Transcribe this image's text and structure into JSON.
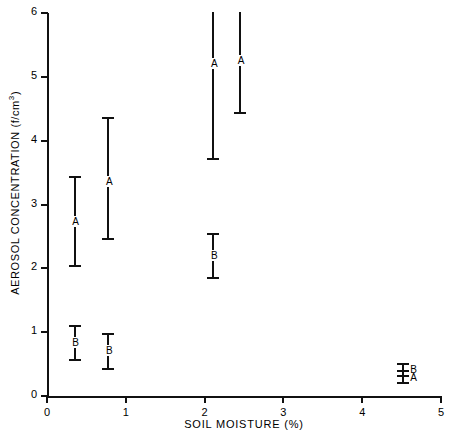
{
  "chart_data": {
    "type": "scatter",
    "title": "",
    "xlabel": "SOIL MOISTURE (%)",
    "ylabel": "AEROSOL CONCENTRATION (f/cm3)",
    "ylabel_main": "AEROSOL  CONCENTRATION  (f/cm",
    "ylabel_sup": "3",
    "ylabel_close": ")",
    "xlim": [
      0,
      5
    ],
    "ylim": [
      0,
      6
    ],
    "xticks": [
      "0",
      "1",
      "2",
      "3",
      "4",
      "5"
    ],
    "yticks": [
      "0",
      "1",
      "2",
      "3",
      "4",
      "5",
      "6"
    ],
    "grid": false,
    "legend": "none",
    "series": [
      {
        "name": "A",
        "points": [
          {
            "label": "A",
            "x": 0.35,
            "y": 2.73,
            "low": 2.02,
            "high": 3.45,
            "clipped_top": false
          },
          {
            "label": "A",
            "x": 0.78,
            "y": 3.35,
            "low": 2.45,
            "high": 4.37,
            "clipped_top": false
          },
          {
            "label": "A",
            "x": 2.11,
            "y": 5.2,
            "low": 3.7,
            "high": 6.2,
            "clipped_top": true
          },
          {
            "label": "A",
            "x": 2.45,
            "y": 5.25,
            "low": 4.42,
            "high": 6.2,
            "clipped_top": true
          },
          {
            "label": "A",
            "x": 4.52,
            "y": 0.28,
            "low": 0.18,
            "high": 0.4,
            "clipped_top": false
          }
        ]
      },
      {
        "name": "B",
        "points": [
          {
            "label": "B",
            "x": 0.35,
            "y": 0.83,
            "low": 0.55,
            "high": 1.11,
            "clipped_top": false
          },
          {
            "label": "B",
            "x": 0.78,
            "y": 0.7,
            "low": 0.4,
            "high": 0.98,
            "clipped_top": false
          },
          {
            "label": "B",
            "x": 2.11,
            "y": 2.19,
            "low": 1.83,
            "high": 2.55,
            "clipped_top": false
          },
          {
            "label": "B",
            "x": 4.52,
            "y": 0.4,
            "low": 0.3,
            "high": 0.52,
            "clipped_top": false
          }
        ]
      }
    ],
    "marks": [
      {
        "id": "a1",
        "label": "A",
        "x": 0.35,
        "center": 2.73,
        "low": 2.02,
        "high": 3.45,
        "clip_top": false,
        "label_pos": "center"
      },
      {
        "id": "a2",
        "label": "A",
        "x": 0.78,
        "center": 3.35,
        "low": 2.45,
        "high": 4.37,
        "clip_top": false,
        "label_pos": "center"
      },
      {
        "id": "b1",
        "label": "B",
        "x": 0.35,
        "center": 0.83,
        "low": 0.55,
        "high": 1.11,
        "clip_top": false,
        "label_pos": "center"
      },
      {
        "id": "b2",
        "label": "B",
        "x": 0.78,
        "center": 0.7,
        "low": 0.4,
        "high": 0.98,
        "clip_top": false,
        "label_pos": "center"
      },
      {
        "id": "a3",
        "label": "A",
        "x": 2.11,
        "center": 5.2,
        "low": 3.7,
        "high": 6.2,
        "clip_top": true,
        "label_pos": "center"
      },
      {
        "id": "a4",
        "label": "A",
        "x": 2.45,
        "center": 5.25,
        "low": 4.42,
        "high": 6.2,
        "clip_top": true,
        "label_pos": "center"
      },
      {
        "id": "b3",
        "label": "B",
        "x": 2.11,
        "center": 2.19,
        "low": 1.83,
        "high": 2.55,
        "clip_top": false,
        "label_pos": "center"
      },
      {
        "id": "b4",
        "label": "B",
        "x": 4.52,
        "center": 0.4,
        "low": 0.3,
        "high": 0.52,
        "clip_top": false,
        "label_pos": "side"
      },
      {
        "id": "a5",
        "label": "A",
        "x": 4.52,
        "center": 0.28,
        "low": 0.18,
        "high": 0.4,
        "clip_top": false,
        "label_pos": "side"
      }
    ]
  },
  "colors": {
    "ink": "#111111",
    "background": "#ffffff"
  }
}
